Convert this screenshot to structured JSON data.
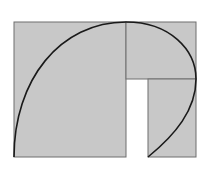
{
  "diagram": {
    "type": "golden-spiral-squares",
    "fill_color": "#c8c8c8",
    "stroke_color": "#6e6e6e",
    "curve_color": "#1a1a1a",
    "background": "#ffffff",
    "shapes": [
      {
        "name": "large-square",
        "x": 14,
        "y": 22,
        "w": 112,
        "h": 135
      },
      {
        "name": "top-right-rect",
        "x": 126,
        "y": 22,
        "w": 70,
        "h": 57
      },
      {
        "name": "bottom-right-rect",
        "x": 148,
        "y": 79,
        "w": 48,
        "h": 78
      }
    ],
    "curve": "M14,157 C14,80 60,22 126,22 C170,22 196,50 196,79 C196,110 175,135 148,157"
  }
}
